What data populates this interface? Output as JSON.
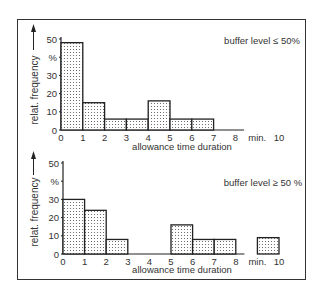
{
  "chart_data": [
    {
      "type": "bar",
      "title": "buffer level ≤ 50%",
      "xlabel": "allowance time duration",
      "ylabel": "relat. frequency",
      "yunit": "%",
      "xunit": "min.",
      "bins": [
        [
          0,
          1
        ],
        [
          1,
          2
        ],
        [
          2,
          3
        ],
        [
          3,
          4
        ],
        [
          4,
          5
        ],
        [
          5,
          6
        ],
        [
          6,
          7
        ]
      ],
      "values": [
        48,
        15,
        6,
        6,
        16,
        6,
        6
      ],
      "xticks": [
        "0",
        "1",
        "2",
        "3",
        "4",
        "5",
        "6",
        "7",
        "8",
        "min.",
        "10"
      ],
      "yticks": [
        "0",
        "10",
        "20",
        "30",
        "%",
        "50"
      ],
      "ylim": [
        0,
        50
      ],
      "xlim": [
        0,
        10
      ]
    },
    {
      "type": "bar",
      "title": "buffer level ≥ 50 %",
      "xlabel": "allowance time duration",
      "ylabel": "relat. frequency",
      "yunit": "%",
      "xunit": "min.",
      "bins": [
        [
          0,
          1
        ],
        [
          1,
          2
        ],
        [
          2,
          3
        ],
        [
          5,
          6
        ],
        [
          6,
          7
        ],
        [
          7,
          8
        ],
        [
          9,
          10
        ]
      ],
      "values": [
        30,
        24,
        8,
        16,
        8,
        8,
        9
      ],
      "xticks": [
        "0",
        "1",
        "2",
        "3",
        "4",
        "5",
        "6",
        "7",
        "8",
        "min.",
        "10"
      ],
      "yticks": [
        "0",
        "10",
        "20",
        "30",
        "%",
        "50"
      ],
      "ylim": [
        0,
        50
      ],
      "xlim": [
        0,
        10
      ]
    }
  ],
  "charts": [
    {
      "title": "buffer level ≤ 50%",
      "xlabel": "allowance time duration",
      "ylabel": "relat. frequency"
    },
    {
      "title": "buffer level ≥ 50 %",
      "xlabel": "allowance time duration",
      "ylabel": "relat. frequency"
    }
  ],
  "colors": {
    "stroke": "#222222",
    "dots": "#555555",
    "fill": "#ffffff"
  }
}
